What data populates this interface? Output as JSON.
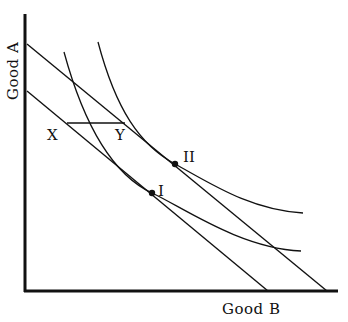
{
  "diagram": {
    "type": "indifference-curve",
    "axes": {
      "y_label": "Good A",
      "x_label": "Good B"
    },
    "labels": {
      "point_1": "I",
      "point_2": "II",
      "x_marker": "X",
      "y_marker": "Y"
    },
    "elements": [
      {
        "name": "budget line (lower)",
        "from": [
          27,
          91
        ],
        "to": [
          268,
          291
        ]
      },
      {
        "name": "budget line (upper)",
        "from": [
          27,
          44
        ],
        "to": [
          327,
          291
        ]
      },
      {
        "name": "indifference curve I",
        "tangent_point": [
          152,
          193
        ]
      },
      {
        "name": "indifference curve II",
        "tangent_point": [
          175,
          164
        ]
      },
      {
        "name": "horizontal segment X-Y",
        "from": [
          67,
          123
        ],
        "to": [
          125,
          123
        ]
      }
    ],
    "colors": {
      "line": "#111111",
      "background": "#ffffff"
    }
  }
}
